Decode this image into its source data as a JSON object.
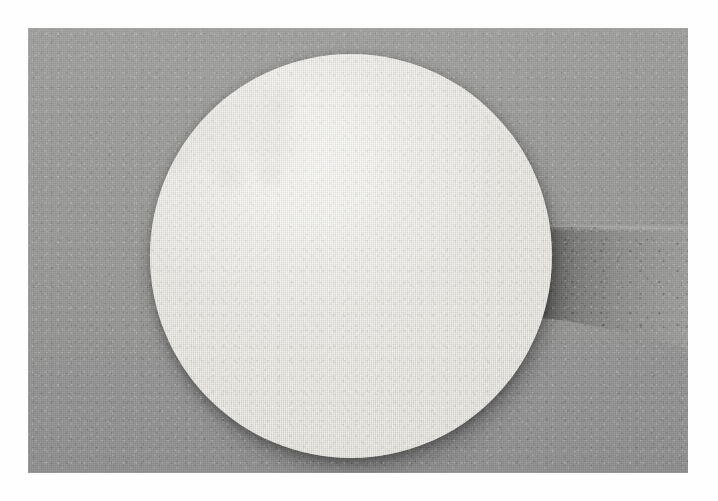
{
  "page": {
    "background_color": "#fefefe",
    "width": 718,
    "height": 501,
    "caption": "Large circular off-white paper disc held upright against a plain gray studio backdrop, with a bare forearm visible behind it on the right."
  },
  "photograph": {
    "alt_text": "Round white fibrous disc on gray background",
    "frame": {
      "left": 28,
      "top": 28,
      "width": 660,
      "height": 445,
      "margin_color": "#fefefe"
    },
    "backdrop": {
      "label": "gray studio backdrop",
      "color": "#969694",
      "color_light": "#9d9d9b",
      "color_dark": "#8d8d8d",
      "texture": "fine canvas weave"
    },
    "subjects": [
      {
        "name": "white-disc",
        "label": "circular white disc",
        "shape": "circle",
        "center_x": 349,
        "center_y": 255,
        "radius": 199,
        "color": "#e8e6e1",
        "color_highlight": "#f0efeb",
        "color_shadow": "#d2cfc9",
        "rim_color": "#6e6c68",
        "texture": "fibrous paper / felt weave",
        "lighting": "key light from upper left"
      },
      {
        "name": "forearm",
        "label": "forearm behind disc",
        "shape": "horizontal band",
        "left": 480,
        "top": 150,
        "width": 200,
        "height": 200,
        "color": "#8a8a88",
        "color_shadow": "#6f6f6d",
        "color_light": "#9e9e9c",
        "texture": "skin with fine speckle"
      }
    ]
  }
}
